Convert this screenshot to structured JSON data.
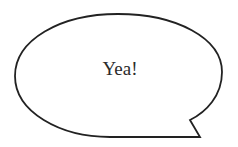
{
  "speech_bubble": {
    "text": "Yea!",
    "stroke_color": "#222222",
    "fill_color": "#ffffff",
    "text_color": "#2b2b2b"
  }
}
